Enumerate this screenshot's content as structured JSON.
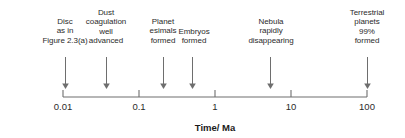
{
  "figure": {
    "background_color": "#ffffff",
    "text_color": "#2b2b2b",
    "line_color": "#6e6e6e"
  },
  "axis": {
    "label": "Time/ Ma",
    "label_x": 215,
    "label_y": 122,
    "scale": "log",
    "line_y": 97,
    "x_start": 63,
    "x_end": 367,
    "tick_length": 7,
    "ticks": [
      {
        "text": "0.01",
        "value": 0.01,
        "x": 63
      },
      {
        "text": "0.1",
        "value": 0.1,
        "x": 139
      },
      {
        "text": "1",
        "value": 1,
        "x": 215
      },
      {
        "text": "10",
        "value": 10,
        "x": 291
      },
      {
        "text": "100",
        "value": 100,
        "x": 367
      }
    ],
    "tick_label_y": 101
  },
  "events": [
    {
      "name": "disc-as-in-figure",
      "lines": [
        "Disc",
        "as in",
        "Figure 2.3(a)"
      ],
      "time_value": 0.01,
      "arrow_x": 65,
      "arrow_top": 57,
      "arrow_bottom": 89,
      "label_x": 65,
      "label_top": 17
    },
    {
      "name": "dust-coagulation-well-advanced",
      "lines": [
        "Dust",
        "coagulation",
        "well",
        "advanced"
      ],
      "time_value": 0.035,
      "arrow_x": 106,
      "arrow_top": 57,
      "arrow_bottom": 89,
      "label_x": 106,
      "label_top": 8
    },
    {
      "name": "planetesimals-formed",
      "lines": [
        "Planet",
        "esimals",
        "formed"
      ],
      "time_value": 0.2,
      "arrow_x": 163,
      "arrow_top": 57,
      "arrow_bottom": 89,
      "label_x": 163,
      "label_top": 17
    },
    {
      "name": "embryos-formed",
      "lines": [
        "Embryos",
        "formed"
      ],
      "time_value": 0.5,
      "arrow_x": 192,
      "arrow_top": 57,
      "arrow_bottom": 89,
      "label_x": 194,
      "label_top": 27
    },
    {
      "name": "nebula-rapidly-disappearing",
      "lines": [
        "Nebula",
        "rapidly",
        "disappearing"
      ],
      "time_value": 5,
      "arrow_x": 270,
      "arrow_top": 57,
      "arrow_bottom": 89,
      "label_x": 271,
      "label_top": 17
    },
    {
      "name": "terrestrial-planets-formed",
      "lines": [
        "Terrestrial",
        "planets",
        "99%",
        "formed"
      ],
      "time_value": 100,
      "arrow_x": 367,
      "arrow_top": 57,
      "arrow_bottom": 89,
      "label_x": 367,
      "label_top": 8
    }
  ]
}
